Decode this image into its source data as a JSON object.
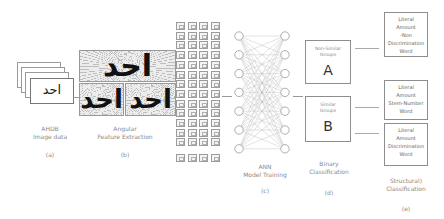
{
  "stages": {
    "a": {
      "title_line1": "AHDB",
      "title_line2": "Image data",
      "tag": "(a)",
      "card_text": "احد"
    },
    "b": {
      "title_line1": "Angular",
      "title_line2": "Feature Extraction",
      "tag": "(b)",
      "word": "احد"
    },
    "c": {
      "title_line1": "ANN",
      "title_line2": "Model Training",
      "tag": "(c)"
    },
    "d": {
      "title_line1": "Binary",
      "title_line2": "Classification",
      "tag": "(d)",
      "group_a": {
        "label_line1": "Non-Similar",
        "label_line2": "Groups",
        "letter": "A"
      },
      "group_b": {
        "label_line1": "Similar",
        "label_line2": "Groups",
        "letter": "B"
      }
    },
    "e": {
      "title_line1": "Structural)",
      "title_line2": "Classification",
      "tag": "(e)",
      "boxes": [
        {
          "lines": [
            "Literal",
            "Amount",
            "-Non",
            "Discrimination",
            "Word"
          ]
        },
        {
          "lines": [
            "Literal",
            "Amount",
            "Stem-Number",
            "Word"
          ]
        },
        {
          "lines": [
            "Literal",
            "Amount",
            "Discrimination",
            "Word"
          ]
        }
      ]
    }
  },
  "feature_grid": {
    "columns": 4,
    "row_labels": [
      "0",
      "1",
      "2",
      "3",
      "4",
      "5",
      "6",
      "7",
      "8",
      "9",
      "10",
      "11",
      "12"
    ],
    "last_row_label": "n"
  },
  "ann": {
    "input_nodes": 7,
    "output_nodes": 7
  }
}
